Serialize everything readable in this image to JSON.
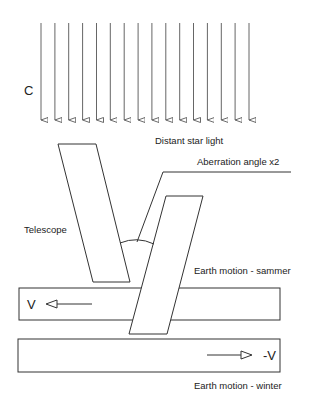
{
  "labels": {
    "speed_of_light": "C",
    "distant_star_light": "Distant star light",
    "aberration_angle": "Aberration angle x2",
    "telescope": "Telescope",
    "earth_motion_summer": "Earth motion - sammer",
    "earth_motion_winter": "Earth motion - winter",
    "velocity_left": "V",
    "velocity_right": "-V"
  },
  "light_rays": {
    "count": 16,
    "x_start": 41,
    "x_end": 249,
    "y_top": 23,
    "y_tip": 127
  },
  "colors": {
    "line": "#333333",
    "text": "#222222",
    "background": "#ffffff"
  }
}
